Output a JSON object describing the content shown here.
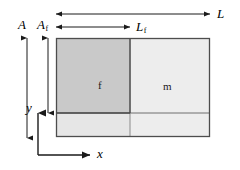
{
  "diagram": {
    "background_color": "#ffffff",
    "line_color": "#1a1a1a",
    "box": {
      "x": 56,
      "y": 38,
      "width": 154,
      "height": 99,
      "border_color": "#4d4d4d"
    },
    "dividers": {
      "vertical_x": 130,
      "horizontal_y": 113,
      "color": "#808080"
    },
    "regions": [
      {
        "name": "fiber",
        "label": "f",
        "fill": "#c9c9c9",
        "x": 56,
        "y": 38,
        "width": 74,
        "height": 75,
        "label_x": 99,
        "label_y": 81
      },
      {
        "name": "matrix",
        "label": "m",
        "fill": "#ededed",
        "x": 130,
        "y": 38,
        "width": 80,
        "height": 75,
        "label_x": 165,
        "label_y": 82
      },
      {
        "name": "lower-strip-left",
        "label": "",
        "fill": "#e4e4e4",
        "x": 56,
        "y": 113,
        "width": 74,
        "height": 24,
        "label_x": 0,
        "label_y": 0
      },
      {
        "name": "lower-strip-right",
        "label": "",
        "fill": "#ededed",
        "x": 130,
        "y": 113,
        "width": 80,
        "height": 24,
        "label_x": 0,
        "label_y": 0
      }
    ],
    "dimensions": [
      {
        "name": "overall-length",
        "label": "L",
        "subscript": "",
        "orientation": "horizontal",
        "arrow_heads": "both",
        "from_x": 56,
        "to_x": 210,
        "y": 14,
        "label_x": 217,
        "label_y": 8
      },
      {
        "name": "fiber-length",
        "label": "L",
        "subscript": "f",
        "orientation": "horizontal",
        "arrow_heads": "both",
        "from_x": 56,
        "to_x": 130,
        "y": 27,
        "label_x": 136,
        "label_y": 21
      },
      {
        "name": "overall-area",
        "label": "A",
        "subscript": "",
        "orientation": "vertical",
        "arrow_heads": "both",
        "x": 27,
        "from_y": 38,
        "to_y": 138,
        "label_x": 19,
        "label_y": 19
      },
      {
        "name": "fiber-area",
        "label": "A",
        "subscript": "f",
        "orientation": "vertical",
        "arrow_heads": "both",
        "x": 48,
        "from_y": 38,
        "to_y": 113,
        "label_x": 38,
        "label_y": 19
      }
    ],
    "axes": {
      "origin_x": 38,
      "origin_y": 155,
      "x_axis": {
        "name": "x-axis",
        "label": "x",
        "to_x": 90,
        "label_x": 99,
        "label_y": 149
      },
      "y_axis": {
        "name": "y-axis",
        "label": "y",
        "to_y": 113,
        "label_x": 27,
        "label_y": 103
      }
    }
  }
}
